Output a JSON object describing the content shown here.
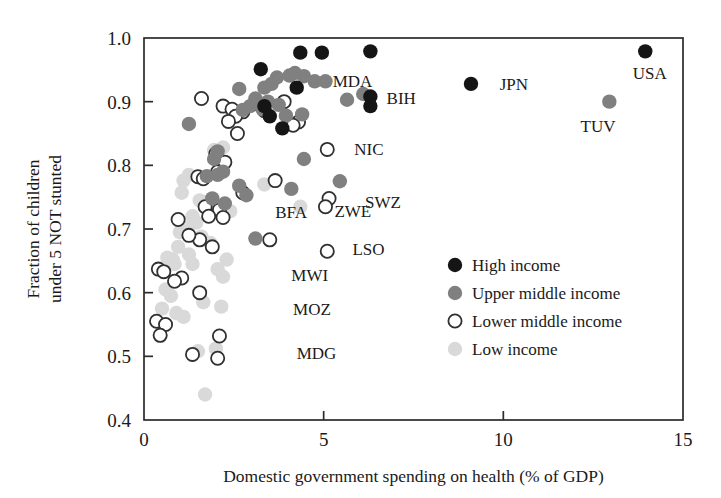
{
  "chart_data": {
    "type": "scatter",
    "title": "",
    "xlabel": "Domestic government spending on health (% of GDP)",
    "ylabel": "Fraction of children\nunder 5 NOT stunted",
    "ylabel_line1": "Fraction of children",
    "ylabel_line2": "under 5 NOT stunted",
    "xlim": [
      0,
      15
    ],
    "ylim": [
      0.4,
      1.0
    ],
    "xticks": [
      0,
      5,
      10,
      15
    ],
    "xtick_labels": [
      "0",
      "5",
      "10",
      "15"
    ],
    "yticks": [
      0.4,
      0.5,
      0.6,
      0.7,
      0.8,
      0.9,
      1.0
    ],
    "ytick_labels": [
      "0.4",
      "0.5",
      "0.6",
      "0.7",
      "0.8",
      "0.9",
      "1.0"
    ],
    "grid": false,
    "legend_position": "lower right",
    "colors": {
      "high_income": "#151515",
      "upper_middle_income": "#808080",
      "lower_middle_income_stroke": "#303030",
      "lower_middle_income_fill": "#ffffff",
      "low_income": "#d9d9d9",
      "axis": "#2b2b2b",
      "background": "#ffffff"
    },
    "legend": [
      {
        "key": "high",
        "label": "High income",
        "marker": "filled-black"
      },
      {
        "key": "upper",
        "label": "Upper middle income",
        "marker": "filled-gray"
      },
      {
        "key": "lower",
        "label": "Lower middle income",
        "marker": "open-circle"
      },
      {
        "key": "low",
        "label": "Low income",
        "marker": "filled-lightgray"
      }
    ],
    "annotations": [
      {
        "text": "MDA",
        "x": 5.25,
        "y": 0.932
      },
      {
        "text": "BIH",
        "x": 6.75,
        "y": 0.905
      },
      {
        "text": "JPN",
        "x": 9.9,
        "y": 0.928
      },
      {
        "text": "USA",
        "x": 13.6,
        "y": 0.945
      },
      {
        "text": "TUV",
        "x": 12.15,
        "y": 0.862
      },
      {
        "text": "NIC",
        "x": 5.85,
        "y": 0.825
      },
      {
        "text": "SWZ",
        "x": 6.15,
        "y": 0.742
      },
      {
        "text": "ZWE",
        "x": 5.3,
        "y": 0.728
      },
      {
        "text": "BFA",
        "x": 3.65,
        "y": 0.726
      },
      {
        "text": "LSO",
        "x": 5.8,
        "y": 0.668
      },
      {
        "text": "MWI",
        "x": 4.1,
        "y": 0.628
      },
      {
        "text": "MOZ",
        "x": 4.15,
        "y": 0.575
      },
      {
        "text": "MDG",
        "x": 4.25,
        "y": 0.505
      }
    ],
    "series": [
      {
        "name": "High income",
        "key": "high",
        "marker": "filled-black",
        "points": [
          [
            4.35,
            0.977
          ],
          [
            4.95,
            0.977
          ],
          [
            6.3,
            0.979
          ],
          [
            13.95,
            0.979
          ],
          [
            3.25,
            0.951
          ],
          [
            4.25,
            0.922
          ],
          [
            9.1,
            0.928
          ],
          [
            6.3,
            0.908
          ],
          [
            6.3,
            0.893
          ],
          [
            3.35,
            0.893
          ],
          [
            3.5,
            0.877
          ],
          [
            3.85,
            0.858
          ]
        ]
      },
      {
        "name": "Upper middle income",
        "key": "upper",
        "marker": "filled-gray",
        "points": [
          [
            4.2,
            0.945
          ],
          [
            4.05,
            0.941
          ],
          [
            4.45,
            0.94
          ],
          [
            3.7,
            0.938
          ],
          [
            4.75,
            0.932
          ],
          [
            5.05,
            0.932
          ],
          [
            3.55,
            0.928
          ],
          [
            2.65,
            0.92
          ],
          [
            3.35,
            0.922
          ],
          [
            5.65,
            0.903
          ],
          [
            6.1,
            0.912
          ],
          [
            3.1,
            0.905
          ],
          [
            3.45,
            0.9
          ],
          [
            2.95,
            0.893
          ],
          [
            3.3,
            0.888
          ],
          [
            3.75,
            0.895
          ],
          [
            4.4,
            0.88
          ],
          [
            3.95,
            0.878
          ],
          [
            2.75,
            0.887
          ],
          [
            1.25,
            0.865
          ],
          [
            12.95,
            0.9
          ],
          [
            2.05,
            0.822
          ],
          [
            1.95,
            0.81
          ],
          [
            4.45,
            0.81
          ],
          [
            2.2,
            0.79
          ],
          [
            2.05,
            0.785
          ],
          [
            1.75,
            0.783
          ],
          [
            5.45,
            0.775
          ],
          [
            4.1,
            0.763
          ],
          [
            2.65,
            0.768
          ],
          [
            2.85,
            0.753
          ],
          [
            3.1,
            0.685
          ],
          [
            2.25,
            0.74
          ],
          [
            1.9,
            0.748
          ]
        ]
      },
      {
        "name": "Lower middle income",
        "key": "lower",
        "marker": "open-circle",
        "points": [
          [
            1.6,
            0.905
          ],
          [
            2.2,
            0.893
          ],
          [
            3.15,
            0.897
          ],
          [
            3.9,
            0.9
          ],
          [
            2.45,
            0.888
          ],
          [
            2.75,
            0.884
          ],
          [
            3.35,
            0.886
          ],
          [
            2.55,
            0.877
          ],
          [
            2.35,
            0.869
          ],
          [
            4.3,
            0.868
          ],
          [
            4.15,
            0.863
          ],
          [
            2.6,
            0.85
          ],
          [
            5.1,
            0.825
          ],
          [
            2.0,
            0.818
          ],
          [
            2.25,
            0.805
          ],
          [
            1.5,
            0.782
          ],
          [
            1.65,
            0.779
          ],
          [
            2.05,
            0.79
          ],
          [
            3.65,
            0.776
          ],
          [
            2.75,
            0.757
          ],
          [
            5.15,
            0.748
          ],
          [
            5.05,
            0.735
          ],
          [
            1.7,
            0.735
          ],
          [
            2.1,
            0.73
          ],
          [
            2.2,
            0.718
          ],
          [
            1.8,
            0.72
          ],
          [
            3.5,
            0.683
          ],
          [
            5.1,
            0.665
          ],
          [
            1.55,
            0.683
          ],
          [
            1.9,
            0.672
          ],
          [
            0.4,
            0.637
          ],
          [
            0.55,
            0.633
          ],
          [
            1.05,
            0.623
          ],
          [
            0.85,
            0.618
          ],
          [
            1.55,
            0.6
          ],
          [
            0.35,
            0.555
          ],
          [
            0.6,
            0.55
          ],
          [
            0.45,
            0.533
          ],
          [
            2.1,
            0.532
          ],
          [
            1.35,
            0.503
          ],
          [
            2.05,
            0.497
          ],
          [
            0.95,
            0.715
          ],
          [
            1.25,
            0.69
          ]
        ]
      },
      {
        "name": "Low income",
        "key": "low",
        "marker": "filled-lightgray",
        "points": [
          [
            2.2,
            0.828
          ],
          [
            1.95,
            0.824
          ],
          [
            1.25,
            0.785
          ],
          [
            1.1,
            0.776
          ],
          [
            1.05,
            0.757
          ],
          [
            1.9,
            0.735
          ],
          [
            2.4,
            0.728
          ],
          [
            4.35,
            0.735
          ],
          [
            1.55,
            0.745
          ],
          [
            1.7,
            0.742
          ],
          [
            1.35,
            0.72
          ],
          [
            1.45,
            0.71
          ],
          [
            1.2,
            0.702
          ],
          [
            1.0,
            0.695
          ],
          [
            1.6,
            0.688
          ],
          [
            1.85,
            0.678
          ],
          [
            0.95,
            0.672
          ],
          [
            1.25,
            0.66
          ],
          [
            2.3,
            0.652
          ],
          [
            1.35,
            0.645
          ],
          [
            2.05,
            0.637
          ],
          [
            2.2,
            0.625
          ],
          [
            0.85,
            0.645
          ],
          [
            0.6,
            0.605
          ],
          [
            0.75,
            0.595
          ],
          [
            1.65,
            0.585
          ],
          [
            2.15,
            0.578
          ],
          [
            0.5,
            0.575
          ],
          [
            0.9,
            0.568
          ],
          [
            1.1,
            0.562
          ],
          [
            2.0,
            0.512
          ],
          [
            1.5,
            0.508
          ],
          [
            1.7,
            0.44
          ],
          [
            0.8,
            0.652
          ],
          [
            3.35,
            0.77
          ],
          [
            0.65,
            0.655
          ]
        ]
      }
    ]
  }
}
